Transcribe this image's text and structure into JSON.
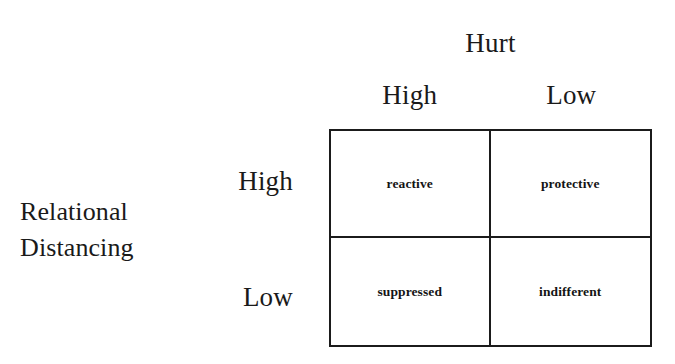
{
  "figure": {
    "type": "2x2-matrix",
    "column_axis": {
      "title": "Hurt",
      "headers": [
        "High",
        "Low"
      ]
    },
    "row_axis": {
      "title_line_1": "Relational",
      "title_line_2": "Distancing",
      "headers": [
        "High",
        "Low"
      ]
    },
    "cells": [
      {
        "row": "High",
        "column": "High",
        "label": "reactive"
      },
      {
        "row": "High",
        "column": "Low",
        "label": "protective"
      },
      {
        "row": "Low",
        "column": "High",
        "label": "suppressed"
      },
      {
        "row": "Low",
        "column": "Low",
        "label": "indifferent"
      }
    ],
    "colors": {
      "background": "#ffffff",
      "border": "#1b1b1b",
      "text": "#1a1a1a"
    }
  }
}
